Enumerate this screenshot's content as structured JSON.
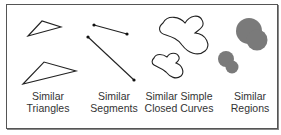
{
  "figure": {
    "panels": [
      {
        "id": "triangles",
        "line1": "Similar",
        "line2": "Triangles"
      },
      {
        "id": "segments",
        "line1": "Similar",
        "line2": "Segments"
      },
      {
        "id": "curves",
        "line1": "Similar Simple",
        "line2": "Closed Curves"
      },
      {
        "id": "regions",
        "line1": "Similar",
        "line2": "Regions"
      }
    ],
    "colors": {
      "stroke": "#222222",
      "region_fill": "#7a7a7a",
      "border": "#555555"
    }
  }
}
